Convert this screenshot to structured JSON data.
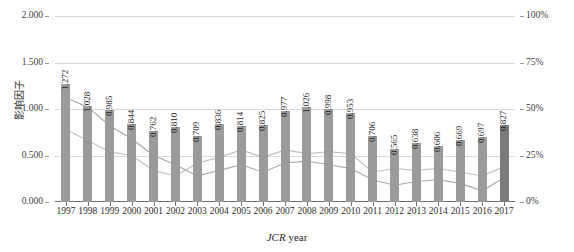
{
  "chart_data": {
    "type": "bar",
    "title": "",
    "xlabel": "JCR year",
    "ylabel": "影响因子",
    "y2label": "领域内百分比排名",
    "categories": [
      "1997",
      "1998",
      "1999",
      "2000",
      "2001",
      "2002",
      "2003",
      "2004",
      "2005",
      "2006",
      "2007",
      "2008",
      "2009",
      "2010",
      "2011",
      "2012",
      "2013",
      "2014",
      "2015",
      "2016",
      "2017"
    ],
    "ylim": [
      0,
      2
    ],
    "y2lim": [
      0,
      100
    ],
    "yticks": [
      "0.000",
      "0.500",
      "1.000",
      "1.500",
      "2.000"
    ],
    "ytick_values": [
      0,
      0.5,
      1.0,
      1.5,
      2.0
    ],
    "y2ticks": [
      "0%",
      "25%",
      "50%",
      "75%",
      "100%"
    ],
    "y2tick_values": [
      0,
      25,
      50,
      75,
      100
    ],
    "grid": true,
    "legend": "none",
    "series": [
      {
        "name": "影响因子",
        "type": "bar",
        "axis": "left",
        "color": "#9b9b9b",
        "highlight_color": "#7a7a7a",
        "highlight_index": 20,
        "values": [
          1.272,
          1.028,
          0.985,
          0.844,
          0.762,
          0.81,
          0.709,
          0.836,
          0.814,
          0.825,
          0.977,
          1.026,
          0.998,
          0.953,
          0.706,
          0.565,
          0.638,
          0.606,
          0.669,
          0.697,
          0.827
        ],
        "labels": [
          "1.272",
          "1.028",
          "0.985",
          "0.844",
          "0.762",
          "0.810",
          "0.709",
          "0.836",
          "0.814",
          "0.825",
          "0.977",
          "1.026",
          "0.998",
          "0.953",
          "0.706",
          "0.565",
          "0.638",
          "0.606",
          "0.669",
          "0.697",
          "0.827"
        ]
      },
      {
        "name": "领域内百分比排名-A",
        "type": "line",
        "axis": "right",
        "color": "#a6a6a6",
        "values": [
          56,
          51,
          41,
          34,
          25,
          20,
          14,
          17,
          20,
          16,
          21,
          22,
          20,
          18,
          12,
          9,
          11,
          12,
          10,
          6,
          13
        ]
      },
      {
        "name": "领域内百分比排名-B",
        "type": "line",
        "axis": "right",
        "color": "#bdbdbd",
        "values": [
          39,
          33,
          27,
          25,
          17,
          14,
          21,
          24,
          28,
          24,
          28,
          26,
          27,
          26,
          16,
          18,
          17,
          18,
          16,
          14,
          19
        ]
      }
    ]
  }
}
